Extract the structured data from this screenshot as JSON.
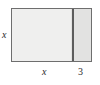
{
  "figure": {
    "type": "geometry-rectangle-partition",
    "shape_name": "rectangle",
    "labels": {
      "height_left": "x",
      "width_left": "x",
      "width_right": "3"
    },
    "colors": {
      "border": "#6e6e6e",
      "divider": "#5c5c5c",
      "fill_left": "#efefee",
      "fill_right": "#e2e2e1",
      "background": "#ffffff",
      "text": "#2b2b2b"
    }
  }
}
